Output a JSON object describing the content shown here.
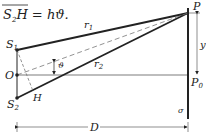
{
  "formula": {
    "lhs_main": "S",
    "lhs_sub": "2",
    "lhs_tail": "H",
    "equals": " = ",
    "rhs": "hϑ."
  },
  "labels": {
    "s1_main": "S",
    "s1_sub": "1",
    "o": "O",
    "s2_main": "S",
    "s2_sub": "2",
    "h": "H",
    "theta": "ϑ",
    "r1_main": "r",
    "r1_sub": "1",
    "r2_main": "r",
    "r2_sub": "2",
    "p": "P",
    "p0_main": "P",
    "p0_sub": "0",
    "y": "y",
    "sigma": "σ",
    "d": "D"
  },
  "colors": {
    "ink": "#222222",
    "dashed": "#777777"
  }
}
